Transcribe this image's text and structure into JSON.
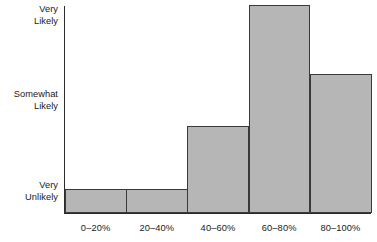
{
  "chart_data": {
    "type": "bar",
    "title": "",
    "subtitle": "",
    "xlabel": "",
    "ylabel": "",
    "categories": [
      "0–20%",
      "20–40%",
      "40–60%",
      "60–80%",
      "80–100%"
    ],
    "values": [
      1.0,
      1.0,
      1.73,
      3.14,
      2.33
    ],
    "ytick_labels": [
      "Very\nUnlikely",
      "Somewhat\nLikely",
      "Very\nLikely"
    ],
    "ytick_values": [
      1,
      2,
      3
    ],
    "ylim": [
      1,
      3.44
    ],
    "xlim_note": "five adjacent bins, no gaps between bars",
    "grid": false,
    "legend": null,
    "annotations": [],
    "colors": {
      "bar_fill": "#b6b6b6",
      "bar_edge": "#3a3a3a",
      "axis": "#2b2b2b",
      "text": "#1a1a1a",
      "background": "#ffffff"
    }
  },
  "axis": {
    "y_labels": [
      {
        "name": "very-likely",
        "text": "Very\nLikely"
      },
      {
        "name": "somewhat-likely",
        "text": "Somewhat\nLikely"
      },
      {
        "name": "very-unlikely",
        "text": "Very\nUnlikely"
      }
    ]
  }
}
